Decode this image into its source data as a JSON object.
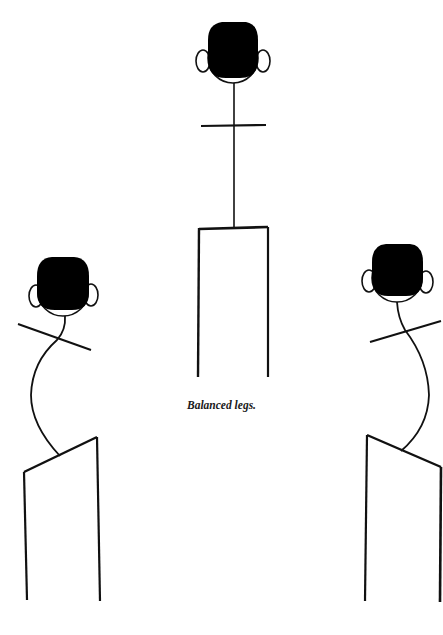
{
  "caption": "Balanced legs.",
  "colors": {
    "background": "#ffffff",
    "ink": "#111111"
  },
  "figures": [
    {
      "id": "left",
      "pose": "shoulders tilted down-right, hips tilted up-right, spine curved left"
    },
    {
      "id": "center",
      "pose": "upright, level shoulders and hips"
    },
    {
      "id": "right",
      "pose": "shoulders tilted up-right, hips tilted down-right, spine curved right"
    }
  ]
}
